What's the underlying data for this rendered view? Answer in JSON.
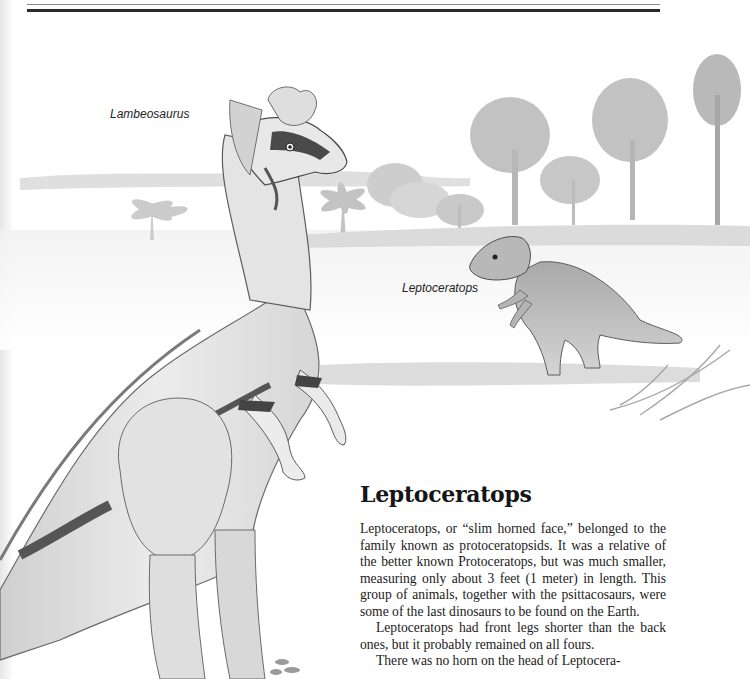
{
  "page": {
    "header_rules": [
      "thin-rule",
      "thick-rule"
    ]
  },
  "illustration": {
    "subjects": [
      "Lambeosaurus",
      "Leptoceratops"
    ],
    "captions": {
      "lambeosaurus": "Lambeosaurus",
      "leptoceratops": "Leptoceratops"
    },
    "colors": {
      "ink": "#3a3a3a",
      "wash": "#c8c8c8",
      "light_wash": "#e4e4e4",
      "dark_band": "#555555"
    }
  },
  "article": {
    "title": "Leptoceratops",
    "paragraphs": [
      "Leptoceratops, or “slim horned face,” belonged to the family known as protoceratopsids. It was a relative of the better known Protoceratops, but was much smaller, measuring only about 3 feet (1 meter) in length. This group of animals, together with the psittacosaurs, were some of the last dinosaurs to be found on the Earth.",
      "Leptoceratops had front legs shorter than the back ones, but it probably remained on all fours.",
      "There was no horn on the head of Leptocera-"
    ]
  }
}
